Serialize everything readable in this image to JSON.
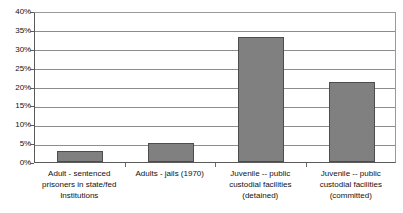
{
  "chart_data": {
    "type": "bar",
    "title": "",
    "subtitle": "",
    "xlabel": "",
    "ylabel": "",
    "categories": [
      "Adult - sentenced prisoners in state/fed Institutions",
      "Adults - jails (1970)",
      "Juvenile -- public custodial facilities (detained)",
      "Juvenile -- public custodial facilities (committed)"
    ],
    "category_lines": [
      [
        "Adult - sentenced",
        "prisoners in state/fed",
        "Institutions"
      ],
      [
        "Adults - jails (1970)"
      ],
      [
        "Juvenile -- public",
        "custodial facilities",
        "(detained)"
      ],
      [
        "Juvenile -- public",
        "custodial facilities",
        "(committed)"
      ]
    ],
    "values": [
      3,
      5,
      33,
      21.3
    ],
    "value_labels": [
      "3%",
      "5%",
      "33%",
      "21%"
    ],
    "ylim": [
      0,
      40
    ],
    "ytick_values": [
      0,
      5,
      10,
      15,
      20,
      25,
      30,
      35,
      40
    ],
    "ytick_labels": [
      "0%",
      "5%",
      "10%",
      "15%",
      "20%",
      "25%",
      "30%",
      "35%",
      "40%"
    ],
    "grid": true,
    "legend": false,
    "legend_position": "none",
    "series": [
      {
        "name": "",
        "values": [
          3,
          5,
          33,
          21.3
        ]
      }
    ]
  },
  "style": {
    "bar_fill": "#808080",
    "bar_border": "#4d4d4d",
    "gridline_color": "#8d8d8d",
    "axis_color": "#5a5a5a",
    "text_color": "#111111",
    "background": "#ffffff"
  }
}
